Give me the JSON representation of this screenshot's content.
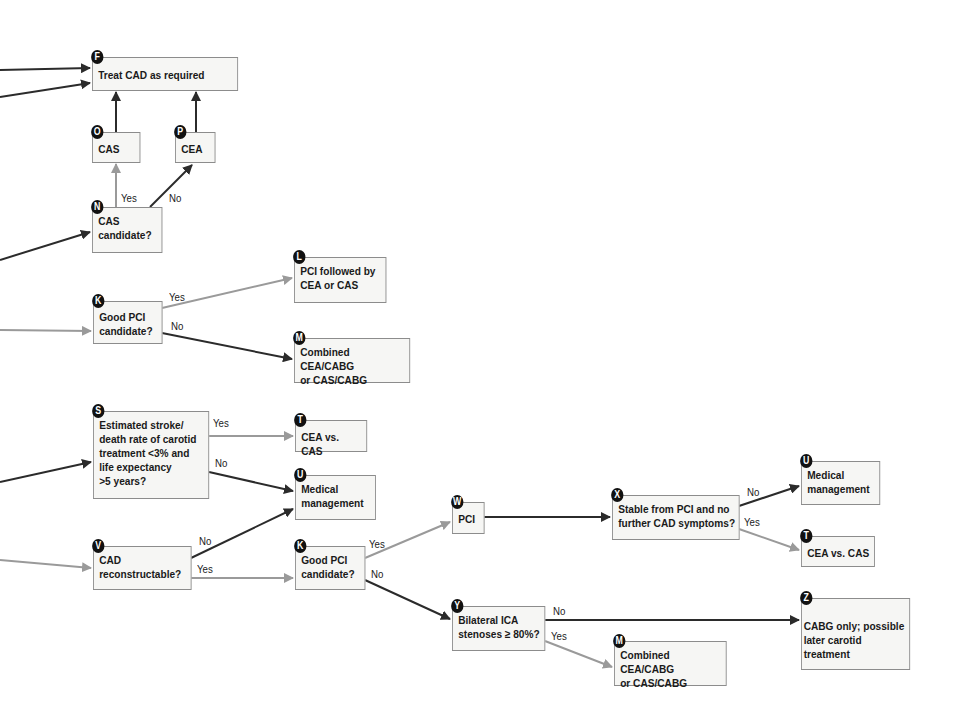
{
  "colors": {
    "dark_arrow": "#2b2b2b",
    "gray_arrow": "#9a9a9a",
    "box_border": "#8c8c8c",
    "box_fill": "#f6f6f4",
    "badge": "#111111"
  },
  "nodes": {
    "F": {
      "badge": "F",
      "text": "Treat CAD as required"
    },
    "O": {
      "badge": "O",
      "text": "CAS"
    },
    "P": {
      "badge": "P",
      "text": "CEA"
    },
    "N": {
      "badge": "N",
      "text": "CAS\ncandidate?"
    },
    "K1": {
      "badge": "K",
      "text": "Good PCI\ncandidate?"
    },
    "L": {
      "badge": "L",
      "text": "PCI followed by\nCEA or CAS"
    },
    "M1": {
      "badge": "M",
      "text": "Combined CEA/CABG\nor CAS/CABG"
    },
    "S": {
      "badge": "S",
      "text": "Estimated stroke/\ndeath rate of carotid\ntreatment <3% and\nlife expectancy\n>5 years?"
    },
    "T1": {
      "badge": "T",
      "text": "CEA vs. CAS"
    },
    "U1": {
      "badge": "U",
      "text": "Medical\nmanagement"
    },
    "V": {
      "badge": "V",
      "text": "CAD\nreconstructable?"
    },
    "K2": {
      "badge": "K",
      "text": "Good PCI\ncandidate?"
    },
    "W": {
      "badge": "W",
      "text": "PCI"
    },
    "X": {
      "badge": "X",
      "text": "Stable from PCI and no\nfurther CAD symptoms?"
    },
    "U2": {
      "badge": "U",
      "text": "Medical\nmanagement"
    },
    "T2": {
      "badge": "T",
      "text": "CEA vs. CAS"
    },
    "Y": {
      "badge": "Y",
      "text": "Bilateral ICA\nstenoses ≥ 80%?"
    },
    "M2": {
      "badge": "M",
      "text": "Combined CEA/CABG\nor CAS/CABG"
    },
    "Z": {
      "badge": "Z",
      "text": "CABG only; possible\nlater carotid treatment"
    }
  },
  "edge_labels": {
    "n_yes": "Yes",
    "n_no": "No",
    "k1_yes": "Yes",
    "k1_no": "No",
    "s_yes": "Yes",
    "s_no": "No",
    "v_no": "No",
    "v_yes": "Yes",
    "k2_yes": "Yes",
    "k2_no": "No",
    "x_no": "No",
    "x_yes": "Yes",
    "y_no": "No",
    "y_yes": "Yes"
  }
}
